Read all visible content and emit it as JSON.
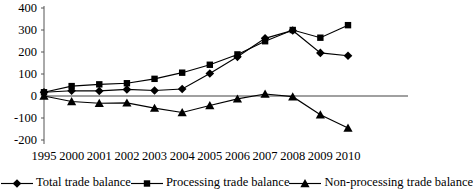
{
  "chart_data": {
    "type": "line",
    "title": "",
    "xlabel": "",
    "ylabel": "",
    "ylim": [
      -200,
      400
    ],
    "ytick_values": [
      400,
      300,
      200,
      100,
      0,
      -100,
      -200
    ],
    "ytick_labels": [
      "400",
      "300",
      "200",
      "100",
      "0",
      "-100",
      "-200"
    ],
    "grid": false,
    "zero_line": true,
    "legend_position": "bottom",
    "categories": [
      "1995",
      "2000",
      "2001",
      "2002",
      "2003",
      "2004",
      "2005",
      "2006",
      "2007",
      "2008",
      "2009",
      "2010"
    ],
    "series": [
      {
        "name": "Total trade balance",
        "marker": "diamond",
        "color": "#000000",
        "values": [
          17,
          24,
          23,
          30,
          25,
          32,
          102,
          178,
          262,
          298,
          196,
          183
        ]
      },
      {
        "name": "Processing trade balance",
        "marker": "square",
        "color": "#000000",
        "values": [
          17,
          45,
          53,
          58,
          78,
          106,
          142,
          189,
          249,
          300,
          265,
          322
        ]
      },
      {
        "name": "Non-processing trade balance",
        "marker": "triangle",
        "color": "#000000",
        "values": [
          0,
          -25,
          -33,
          -31,
          -55,
          -75,
          -43,
          -13,
          9,
          -3,
          -85,
          -145
        ]
      }
    ]
  },
  "legend": {
    "entries": [
      {
        "label": "Total trade balance",
        "marker": "diamond-marker-icon"
      },
      {
        "label": "Processing trade balance",
        "marker": "square-marker-icon"
      },
      {
        "label": "Non-processing trade balance",
        "marker": "triangle-marker-icon"
      }
    ]
  },
  "axes": {
    "y_axis_name": "value-axis",
    "x_axis_name": "year-axis"
  }
}
